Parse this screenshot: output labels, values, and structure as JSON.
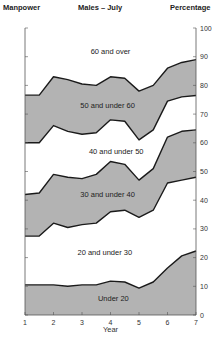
{
  "header": {
    "left": "Manpower",
    "center": "Males – July",
    "right": "Percentage"
  },
  "colors": {
    "band_fill": "#b3b3b3",
    "band_empty": "#ffffff",
    "line": "#1a1a1a",
    "axis": "#555555"
  },
  "chart_data": {
    "type": "area",
    "title": "Males – July",
    "subtitle_left": "Manpower",
    "ylabel": "Percentage",
    "xlabel": "Year",
    "x": [
      1,
      1.5,
      2,
      2.5,
      3,
      3.5,
      4,
      4.5,
      5,
      5.5,
      6,
      6.5,
      7
    ],
    "xticks": [
      "1",
      "2",
      "3",
      "4",
      "5",
      "6",
      "7"
    ],
    "yticks": [
      "0",
      "10",
      "20",
      "30",
      "40",
      "50",
      "60",
      "70",
      "80",
      "90",
      "100"
    ],
    "ylim": [
      0,
      100
    ],
    "xlim": [
      1,
      7
    ],
    "stacked": true,
    "grid": false,
    "series": [
      {
        "name": "Under 20",
        "cumulative_top": [
          10.5,
          10.5,
          10.5,
          10,
          10.5,
          10.5,
          11.8,
          11.5,
          9.4,
          11.5,
          16.4,
          20.6,
          22.3
        ],
        "shaded": true
      },
      {
        "name": "20 and under 30",
        "cumulative_top": [
          27.5,
          27.5,
          32,
          30.5,
          31.5,
          32,
          36,
          36.5,
          34,
          36.5,
          46,
          47,
          48
        ],
        "shaded": false
      },
      {
        "name": "30 and under 40",
        "cumulative_top": [
          42,
          42.5,
          49,
          48,
          47.5,
          49,
          53.5,
          52.5,
          47,
          51,
          62,
          64,
          64.5
        ],
        "shaded": true
      },
      {
        "name": "40 and under 50",
        "cumulative_top": [
          60,
          60,
          66,
          64,
          63,
          63.5,
          68,
          67.5,
          61,
          64.5,
          74.5,
          76,
          76.5
        ],
        "shaded": false
      },
      {
        "name": "50 and under 60",
        "cumulative_top": [
          76.6,
          76.6,
          83,
          82,
          80.5,
          80,
          83,
          82.5,
          78,
          80,
          86,
          88,
          89
        ],
        "shaded": true
      },
      {
        "name": "60 and over",
        "cumulative_top": [
          100,
          100,
          100,
          100,
          100,
          100,
          100,
          100,
          100,
          100,
          100,
          100,
          100
        ],
        "shaded": false
      }
    ],
    "band_labels": [
      {
        "text": "60 and over",
        "x": 4,
        "y": 91
      },
      {
        "text": "50 and under 60",
        "x": 3.9,
        "y": 72
      },
      {
        "text": "40 and under 50",
        "x": 4.2,
        "y": 56
      },
      {
        "text": "30 and under 40",
        "x": 3.9,
        "y": 41
      },
      {
        "text": "20 and under 30",
        "x": 3.8,
        "y": 21
      },
      {
        "text": "Under 20",
        "x": 4.1,
        "y": 5
      }
    ]
  }
}
